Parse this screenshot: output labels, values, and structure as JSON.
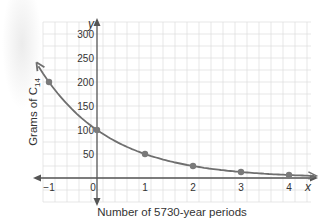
{
  "header": {
    "partial_title": "...(partial text cut off)"
  },
  "chart_data": {
    "type": "line",
    "title": "",
    "xlabel": "Number of 5730-year periods",
    "ylabel": "Grams of C14",
    "ylabel_main": "Grams of C",
    "ylabel_sub": "14",
    "x_axis_letter": "x",
    "y_axis_letter": "y",
    "x": [
      -1,
      0,
      1,
      2,
      3,
      4
    ],
    "values": [
      200,
      100,
      50,
      25,
      12.5,
      6.25
    ],
    "xlim": [
      -1.25,
      4.5
    ],
    "ylim": [
      -50,
      310
    ],
    "x_ticks": [
      "−1",
      "0",
      "1",
      "2",
      "3",
      "4"
    ],
    "y_ticks": [
      "50",
      "100",
      "150",
      "200",
      "250",
      "300"
    ],
    "grid": true,
    "legend": null,
    "curve": "exponential decay y = 100(1/2)^x",
    "colors": {
      "curve": "#6f6f6f",
      "points": "#7a7a7a",
      "axis": "#555555",
      "grid": "#dcdcdc",
      "text": "#333333"
    }
  }
}
